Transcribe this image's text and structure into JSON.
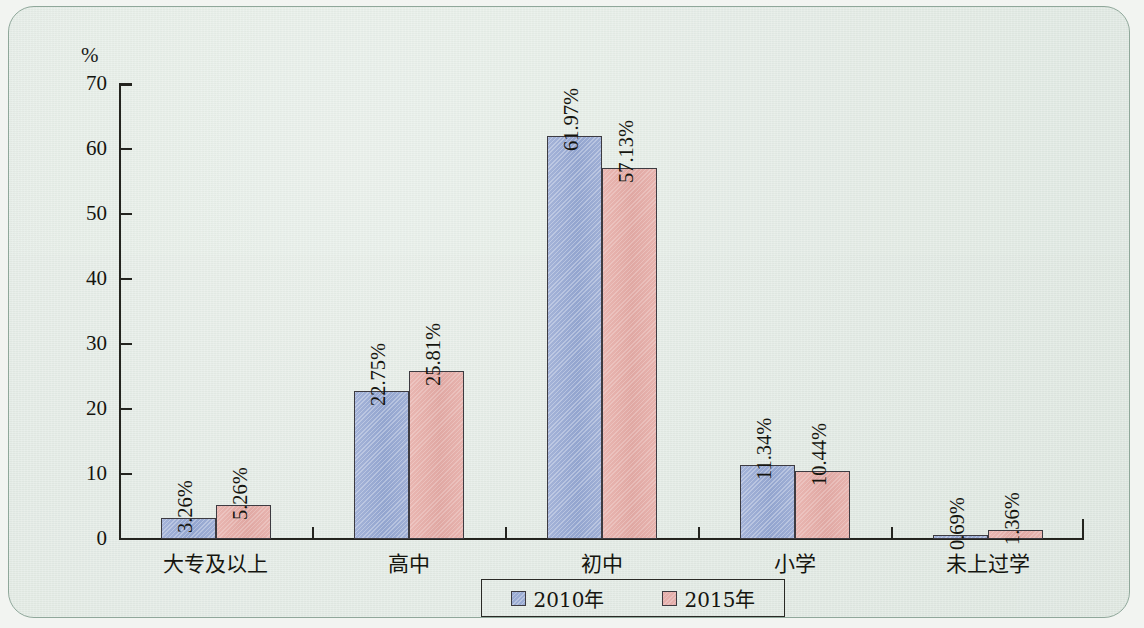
{
  "chart_data": {
    "type": "bar",
    "title": "",
    "xlabel": "",
    "ylabel": "%",
    "unit_label": "%",
    "ylim": [
      0,
      70
    ],
    "yticks": [
      0,
      10,
      20,
      30,
      40,
      50,
      60,
      70
    ],
    "ytick_labels": [
      "0",
      "10",
      "20",
      "30",
      "40",
      "50",
      "60",
      "70"
    ],
    "grid": false,
    "legend_position": "bottom",
    "categories": [
      "大专及以上",
      "高中",
      "初中",
      "小学",
      "未上过学"
    ],
    "series": [
      {
        "name": "2010年",
        "color": "#9aabd3",
        "values": [
          3.26,
          22.75,
          61.97,
          11.34,
          0.69
        ],
        "labels": [
          "3.26%",
          "22.75%",
          "61.97%",
          "11.34%",
          "0.69%"
        ]
      },
      {
        "name": "2015年",
        "color": "#e4aeab",
        "values": [
          5.26,
          25.81,
          57.13,
          10.44,
          1.36
        ],
        "labels": [
          "5.26%",
          "25.81%",
          "57.13%",
          "10.44%",
          "1.36%"
        ]
      }
    ]
  },
  "legend": {
    "items": [
      {
        "label": "2010年",
        "color": "#9aabd3"
      },
      {
        "label": "2015年",
        "color": "#e4aeab"
      }
    ]
  },
  "style": {
    "background": "#e4ece6",
    "frame_border": "#8fa79a",
    "axis_color": "#24241f",
    "text_color": "#15150f",
    "bar_border": "#3d3b41"
  }
}
